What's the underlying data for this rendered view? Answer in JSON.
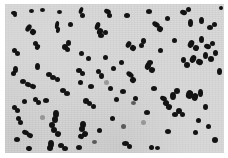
{
  "image": {
    "kind": "photomicrograph",
    "subject": "bacterial cocci smear",
    "width": 228,
    "height": 158,
    "has_visible_text": false,
    "has_scale_bar": false,
    "caption": ""
  },
  "field": {
    "label": "microscope-field",
    "x": 5,
    "y": 4,
    "width": 219,
    "height": 149,
    "background_color": "#d9d9d9",
    "border_color": "#ffffff"
  },
  "page": {
    "margin_color": "#ffffff"
  },
  "cell_style": {
    "color": "#131313",
    "shape": "ellipse",
    "typical_diameter_px": 5
  },
  "colony_arrangement": {
    "forms": [
      "single coccus",
      "diplococcus",
      "short chain",
      "tetrad cluster"
    ],
    "approximate_count": 118
  },
  "cells": [
    {
      "x": 11,
      "y": 11,
      "w": 6,
      "h": 4,
      "r": 10,
      "c": "dark"
    },
    {
      "x": 29,
      "y": 9,
      "w": 5,
      "h": 4,
      "r": 0,
      "c": "dark"
    },
    {
      "x": 57,
      "y": 10,
      "w": 5,
      "h": 4,
      "r": 0,
      "c": "dark"
    },
    {
      "x": 79,
      "y": 7,
      "w": 4,
      "h": 7,
      "r": 20,
      "c": "dark"
    },
    {
      "x": 80,
      "y": 13,
      "w": 5,
      "h": 5,
      "r": 0,
      "c": "dark"
    },
    {
      "x": 104,
      "y": 9,
      "w": 7,
      "h": 5,
      "r": 25,
      "c": "dark"
    },
    {
      "x": 107,
      "y": 13,
      "w": 5,
      "h": 5,
      "r": 0,
      "c": "dark"
    },
    {
      "x": 146,
      "y": 9,
      "w": 6,
      "h": 5,
      "r": 0,
      "c": "dark"
    },
    {
      "x": 180,
      "y": 10,
      "w": 7,
      "h": 5,
      "r": 15,
      "c": "dark"
    },
    {
      "x": 186,
      "y": 7,
      "w": 5,
      "h": 5,
      "r": 0,
      "c": "dark"
    },
    {
      "x": 219,
      "y": 6,
      "w": 4,
      "h": 4,
      "r": 0,
      "c": "dark"
    },
    {
      "x": 13,
      "y": 13,
      "w": 4,
      "h": 4,
      "r": 0,
      "c": "dark"
    },
    {
      "x": 26,
      "y": 24,
      "w": 5,
      "h": 8,
      "r": 35,
      "c": "dark"
    },
    {
      "x": 30,
      "y": 29,
      "w": 6,
      "h": 6,
      "r": 35,
      "c": "dark"
    },
    {
      "x": 55,
      "y": 21,
      "w": 4,
      "h": 8,
      "r": 10,
      "c": "dark"
    },
    {
      "x": 56,
      "y": 27,
      "w": 4,
      "h": 6,
      "r": 10,
      "c": "dark"
    },
    {
      "x": 95,
      "y": 22,
      "w": 5,
      "h": 8,
      "r": 20,
      "c": "dark"
    },
    {
      "x": 97,
      "y": 28,
      "w": 6,
      "h": 7,
      "r": 20,
      "c": "dark"
    },
    {
      "x": 98,
      "y": 33,
      "w": 6,
      "h": 5,
      "r": 0,
      "c": "dark"
    },
    {
      "x": 103,
      "y": 30,
      "w": 5,
      "h": 5,
      "r": 0,
      "c": "dark"
    },
    {
      "x": 152,
      "y": 22,
      "w": 8,
      "h": 5,
      "r": 30,
      "c": "dark"
    },
    {
      "x": 157,
      "y": 26,
      "w": 6,
      "h": 6,
      "r": 30,
      "c": "dark"
    },
    {
      "x": 188,
      "y": 19,
      "w": 5,
      "h": 8,
      "r": 0,
      "c": "dark"
    },
    {
      "x": 199,
      "y": 17,
      "w": 5,
      "h": 7,
      "r": 0,
      "c": "dark"
    },
    {
      "x": 207,
      "y": 25,
      "w": 6,
      "h": 5,
      "r": 0,
      "c": "dark"
    },
    {
      "x": 212,
      "y": 22,
      "w": 5,
      "h": 5,
      "r": 0,
      "c": "dark"
    },
    {
      "x": 12,
      "y": 48,
      "w": 5,
      "h": 5,
      "r": 0,
      "c": "dark"
    },
    {
      "x": 15,
      "y": 51,
      "w": 5,
      "h": 5,
      "r": 0,
      "c": "dark"
    },
    {
      "x": 27,
      "y": 26,
      "w": 4,
      "h": 4,
      "r": 0,
      "c": "dark"
    },
    {
      "x": 33,
      "y": 41,
      "w": 5,
      "h": 5,
      "r": 0,
      "c": "dark"
    },
    {
      "x": 35,
      "y": 44,
      "w": 5,
      "h": 6,
      "r": 20,
      "c": "dark"
    },
    {
      "x": 62,
      "y": 44,
      "w": 6,
      "h": 6,
      "r": 0,
      "c": "dark"
    },
    {
      "x": 66,
      "y": 40,
      "w": 5,
      "h": 6,
      "r": 0,
      "c": "dark"
    },
    {
      "x": 65,
      "y": 47,
      "w": 5,
      "h": 5,
      "r": 0,
      "c": "dark"
    },
    {
      "x": 86,
      "y": 56,
      "w": 5,
      "h": 5,
      "r": 0,
      "c": "dark"
    },
    {
      "x": 126,
      "y": 41,
      "w": 5,
      "h": 7,
      "r": 30,
      "c": "dark"
    },
    {
      "x": 130,
      "y": 45,
      "w": 6,
      "h": 6,
      "r": 30,
      "c": "dark"
    },
    {
      "x": 141,
      "y": 38,
      "w": 5,
      "h": 6,
      "r": 0,
      "c": "dark"
    },
    {
      "x": 139,
      "y": 43,
      "w": 5,
      "h": 5,
      "r": 0,
      "c": "dark"
    },
    {
      "x": 172,
      "y": 38,
      "w": 5,
      "h": 5,
      "r": 0,
      "c": "dark"
    },
    {
      "x": 188,
      "y": 40,
      "w": 6,
      "h": 8,
      "r": 25,
      "c": "dark"
    },
    {
      "x": 193,
      "y": 45,
      "w": 6,
      "h": 6,
      "r": 25,
      "c": "dark"
    },
    {
      "x": 199,
      "y": 36,
      "w": 5,
      "h": 7,
      "r": 0,
      "c": "dark"
    },
    {
      "x": 204,
      "y": 44,
      "w": 7,
      "h": 5,
      "r": 15,
      "c": "dark"
    },
    {
      "x": 210,
      "y": 41,
      "w": 5,
      "h": 5,
      "r": 0,
      "c": "dark"
    },
    {
      "x": 13,
      "y": 66,
      "w": 5,
      "h": 7,
      "r": 0,
      "c": "dark"
    },
    {
      "x": 20,
      "y": 79,
      "w": 6,
      "h": 5,
      "r": 0,
      "c": "dark"
    },
    {
      "x": 25,
      "y": 82,
      "w": 6,
      "h": 5,
      "r": 20,
      "c": "dark"
    },
    {
      "x": 30,
      "y": 84,
      "w": 6,
      "h": 5,
      "r": 20,
      "c": "dark"
    },
    {
      "x": 79,
      "y": 51,
      "w": 5,
      "h": 5,
      "r": 0,
      "c": "dark"
    },
    {
      "x": 76,
      "y": 68,
      "w": 6,
      "h": 5,
      "r": 0,
      "c": "dark"
    },
    {
      "x": 80,
      "y": 71,
      "w": 5,
      "h": 5,
      "r": 0,
      "c": "dark"
    },
    {
      "x": 78,
      "y": 80,
      "w": 5,
      "h": 5,
      "r": 0,
      "c": "dark"
    },
    {
      "x": 96,
      "y": 69,
      "w": 5,
      "h": 5,
      "r": 0,
      "c": "dark"
    },
    {
      "x": 99,
      "y": 73,
      "w": 5,
      "h": 6,
      "r": 0,
      "c": "dark"
    },
    {
      "x": 126,
      "y": 72,
      "w": 8,
      "h": 5,
      "r": 35,
      "c": "dark"
    },
    {
      "x": 130,
      "y": 77,
      "w": 6,
      "h": 6,
      "r": 35,
      "c": "dark"
    },
    {
      "x": 108,
      "y": 86,
      "w": 5,
      "h": 5,
      "r": 0,
      "c": "dark"
    },
    {
      "x": 145,
      "y": 62,
      "w": 6,
      "h": 8,
      "r": 20,
      "c": "dark"
    },
    {
      "x": 149,
      "y": 67,
      "w": 6,
      "h": 6,
      "r": 20,
      "c": "dark"
    },
    {
      "x": 147,
      "y": 60,
      "w": 6,
      "h": 5,
      "r": 0,
      "c": "dark"
    },
    {
      "x": 181,
      "y": 57,
      "w": 5,
      "h": 6,
      "r": 0,
      "c": "dark"
    },
    {
      "x": 184,
      "y": 62,
      "w": 6,
      "h": 6,
      "r": 0,
      "c": "dark"
    },
    {
      "x": 190,
      "y": 55,
      "w": 6,
      "h": 8,
      "r": 25,
      "c": "dark"
    },
    {
      "x": 196,
      "y": 59,
      "w": 7,
      "h": 6,
      "r": 25,
      "c": "dark"
    },
    {
      "x": 203,
      "y": 52,
      "w": 5,
      "h": 7,
      "r": 0,
      "c": "dark"
    },
    {
      "x": 208,
      "y": 56,
      "w": 6,
      "h": 6,
      "r": 0,
      "c": "dark"
    },
    {
      "x": 213,
      "y": 50,
      "w": 5,
      "h": 6,
      "r": 0,
      "c": "dark"
    },
    {
      "x": 11,
      "y": 71,
      "w": 5,
      "h": 5,
      "r": 0,
      "c": "dark"
    },
    {
      "x": 33,
      "y": 97,
      "w": 5,
      "h": 5,
      "r": 0,
      "c": "dark"
    },
    {
      "x": 36,
      "y": 100,
      "w": 5,
      "h": 5,
      "r": 0,
      "c": "dark"
    },
    {
      "x": 16,
      "y": 116,
      "w": 5,
      "h": 5,
      "r": 0,
      "c": "dark"
    },
    {
      "x": 18,
      "y": 120,
      "w": 5,
      "h": 5,
      "r": 0,
      "c": "dark"
    },
    {
      "x": 22,
      "y": 130,
      "w": 7,
      "h": 5,
      "r": 20,
      "c": "dark"
    },
    {
      "x": 27,
      "y": 133,
      "w": 6,
      "h": 5,
      "r": 20,
      "c": "dark"
    },
    {
      "x": 14,
      "y": 137,
      "w": 6,
      "h": 5,
      "r": 0,
      "c": "dark"
    },
    {
      "x": 26,
      "y": 146,
      "w": 6,
      "h": 5,
      "r": 15,
      "c": "dark"
    },
    {
      "x": 53,
      "y": 110,
      "w": 6,
      "h": 8,
      "r": 0,
      "c": "dark"
    },
    {
      "x": 52,
      "y": 116,
      "w": 6,
      "h": 7,
      "r": 0,
      "c": "dark"
    },
    {
      "x": 49,
      "y": 122,
      "w": 6,
      "h": 6,
      "r": 0,
      "c": "dark"
    },
    {
      "x": 51,
      "y": 127,
      "w": 6,
      "h": 6,
      "r": 0,
      "c": "dark"
    },
    {
      "x": 55,
      "y": 131,
      "w": 6,
      "h": 6,
      "r": 20,
      "c": "dark"
    },
    {
      "x": 48,
      "y": 140,
      "w": 6,
      "h": 8,
      "r": 0,
      "c": "dark"
    },
    {
      "x": 47,
      "y": 145,
      "w": 6,
      "h": 6,
      "r": 0,
      "c": "dark"
    },
    {
      "x": 58,
      "y": 143,
      "w": 6,
      "h": 5,
      "r": 0,
      "c": "dark"
    },
    {
      "x": 62,
      "y": 146,
      "w": 6,
      "h": 5,
      "r": 0,
      "c": "dark"
    },
    {
      "x": 43,
      "y": 98,
      "w": 6,
      "h": 5,
      "r": 0,
      "c": "dark"
    },
    {
      "x": 22,
      "y": 99,
      "w": 5,
      "h": 5,
      "r": 0,
      "c": "dark"
    },
    {
      "x": 12,
      "y": 105,
      "w": 5,
      "h": 5,
      "r": 0,
      "c": "dark"
    },
    {
      "x": 15,
      "y": 108,
      "w": 5,
      "h": 5,
      "r": 0,
      "c": "dark"
    },
    {
      "x": 83,
      "y": 98,
      "w": 6,
      "h": 6,
      "r": 0,
      "c": "dark"
    },
    {
      "x": 87,
      "y": 101,
      "w": 5,
      "h": 5,
      "r": 0,
      "c": "dark"
    },
    {
      "x": 91,
      "y": 104,
      "w": 5,
      "h": 5,
      "r": 0,
      "c": "dark"
    },
    {
      "x": 80,
      "y": 121,
      "w": 6,
      "h": 7,
      "r": 0,
      "c": "dark"
    },
    {
      "x": 79,
      "y": 126,
      "w": 6,
      "h": 6,
      "r": 0,
      "c": "dark"
    },
    {
      "x": 82,
      "y": 131,
      "w": 6,
      "h": 6,
      "r": 20,
      "c": "dark"
    },
    {
      "x": 78,
      "y": 134,
      "w": 6,
      "h": 5,
      "r": 20,
      "c": "dark"
    },
    {
      "x": 76,
      "y": 145,
      "w": 6,
      "h": 5,
      "r": 0,
      "c": "dark"
    },
    {
      "x": 97,
      "y": 128,
      "w": 5,
      "h": 5,
      "r": 0,
      "c": "dark"
    },
    {
      "x": 114,
      "y": 97,
      "w": 5,
      "h": 5,
      "r": 0,
      "c": "dark"
    },
    {
      "x": 110,
      "y": 116,
      "w": 5,
      "h": 5,
      "r": 0,
      "c": "dark"
    },
    {
      "x": 121,
      "y": 124,
      "w": 5,
      "h": 5,
      "r": 0,
      "c": "mid"
    },
    {
      "x": 122,
      "y": 141,
      "w": 7,
      "h": 5,
      "r": 0,
      "c": "dark"
    },
    {
      "x": 127,
      "y": 144,
      "w": 5,
      "h": 5,
      "r": 0,
      "c": "dark"
    },
    {
      "x": 144,
      "y": 110,
      "w": 6,
      "h": 5,
      "r": 0,
      "c": "dark"
    },
    {
      "x": 141,
      "y": 120,
      "w": 5,
      "h": 5,
      "r": 0,
      "c": "faint"
    },
    {
      "x": 149,
      "y": 145,
      "w": 5,
      "h": 5,
      "r": 0,
      "c": "dark"
    },
    {
      "x": 155,
      "y": 146,
      "w": 5,
      "h": 4,
      "r": 0,
      "c": "dark"
    },
    {
      "x": 160,
      "y": 96,
      "w": 7,
      "h": 5,
      "r": 25,
      "c": "dark"
    },
    {
      "x": 163,
      "y": 100,
      "w": 6,
      "h": 6,
      "r": 25,
      "c": "dark"
    },
    {
      "x": 166,
      "y": 104,
      "w": 6,
      "h": 6,
      "r": 25,
      "c": "dark"
    },
    {
      "x": 170,
      "y": 92,
      "w": 6,
      "h": 8,
      "r": 0,
      "c": "dark"
    },
    {
      "x": 174,
      "y": 88,
      "w": 6,
      "h": 6,
      "r": 0,
      "c": "dark"
    },
    {
      "x": 176,
      "y": 108,
      "w": 6,
      "h": 6,
      "r": 0,
      "c": "dark"
    },
    {
      "x": 172,
      "y": 112,
      "w": 6,
      "h": 5,
      "r": 0,
      "c": "dark"
    },
    {
      "x": 180,
      "y": 112,
      "w": 5,
      "h": 5,
      "r": 0,
      "c": "dark"
    },
    {
      "x": 186,
      "y": 90,
      "w": 7,
      "h": 9,
      "r": 15,
      "c": "dark"
    },
    {
      "x": 192,
      "y": 93,
      "w": 6,
      "h": 8,
      "r": 15,
      "c": "dark"
    },
    {
      "x": 198,
      "y": 89,
      "w": 5,
      "h": 8,
      "r": 0,
      "c": "dark"
    },
    {
      "x": 203,
      "y": 104,
      "w": 5,
      "h": 6,
      "r": 0,
      "c": "dark"
    },
    {
      "x": 206,
      "y": 124,
      "w": 5,
      "h": 5,
      "r": 0,
      "c": "dark"
    },
    {
      "x": 212,
      "y": 137,
      "w": 6,
      "h": 6,
      "r": 0,
      "c": "dark"
    },
    {
      "x": 193,
      "y": 130,
      "w": 5,
      "h": 5,
      "r": 0,
      "c": "dark"
    },
    {
      "x": 165,
      "y": 129,
      "w": 6,
      "h": 5,
      "r": 0,
      "c": "dark"
    },
    {
      "x": 196,
      "y": 118,
      "w": 5,
      "h": 5,
      "r": 0,
      "c": "dark"
    },
    {
      "x": 151,
      "y": 86,
      "w": 6,
      "h": 5,
      "r": 0,
      "c": "dark"
    },
    {
      "x": 120,
      "y": 89,
      "w": 6,
      "h": 5,
      "r": 0,
      "c": "dark"
    },
    {
      "x": 60,
      "y": 88,
      "w": 6,
      "h": 5,
      "r": 0,
      "c": "dark"
    },
    {
      "x": 64,
      "y": 91,
      "w": 6,
      "h": 5,
      "r": 0,
      "c": "dark"
    },
    {
      "x": 40,
      "y": 115,
      "w": 5,
      "h": 5,
      "r": 0,
      "c": "faint"
    },
    {
      "x": 103,
      "y": 55,
      "w": 5,
      "h": 5,
      "r": 0,
      "c": "dark"
    },
    {
      "x": 119,
      "y": 60,
      "w": 5,
      "h": 5,
      "r": 0,
      "c": "dark"
    },
    {
      "x": 133,
      "y": 96,
      "w": 5,
      "h": 5,
      "r": 0,
      "c": "dark"
    },
    {
      "x": 131,
      "y": 101,
      "w": 5,
      "h": 4,
      "r": 0,
      "c": "mid"
    },
    {
      "x": 35,
      "y": 63,
      "w": 5,
      "h": 7,
      "r": 0,
      "c": "dark"
    },
    {
      "x": 46,
      "y": 72,
      "w": 6,
      "h": 5,
      "r": 0,
      "c": "dark"
    },
    {
      "x": 50,
      "y": 75,
      "w": 6,
      "h": 5,
      "r": 0,
      "c": "dark"
    },
    {
      "x": 55,
      "y": 77,
      "w": 5,
      "h": 5,
      "r": 0,
      "c": "dark"
    },
    {
      "x": 88,
      "y": 84,
      "w": 6,
      "h": 5,
      "r": 0,
      "c": "dark"
    },
    {
      "x": 104,
      "y": 80,
      "w": 5,
      "h": 5,
      "r": 0,
      "c": "faint"
    },
    {
      "x": 68,
      "y": 22,
      "w": 5,
      "h": 5,
      "r": 0,
      "c": "dark"
    },
    {
      "x": 124,
      "y": 13,
      "w": 6,
      "h": 5,
      "r": 0,
      "c": "dark"
    },
    {
      "x": 165,
      "y": 16,
      "w": 5,
      "h": 5,
      "r": 0,
      "c": "dark"
    },
    {
      "x": 40,
      "y": 8,
      "w": 5,
      "h": 4,
      "r": 0,
      "c": "dark"
    },
    {
      "x": 217,
      "y": 68,
      "w": 5,
      "h": 7,
      "r": 0,
      "c": "dark"
    },
    {
      "x": 158,
      "y": 48,
      "w": 5,
      "h": 5,
      "r": 0,
      "c": "dark"
    },
    {
      "x": 111,
      "y": 66,
      "w": 5,
      "h": 5,
      "r": 0,
      "c": "dark"
    },
    {
      "x": 92,
      "y": 140,
      "w": 5,
      "h": 4,
      "r": 0,
      "c": "mid"
    }
  ]
}
